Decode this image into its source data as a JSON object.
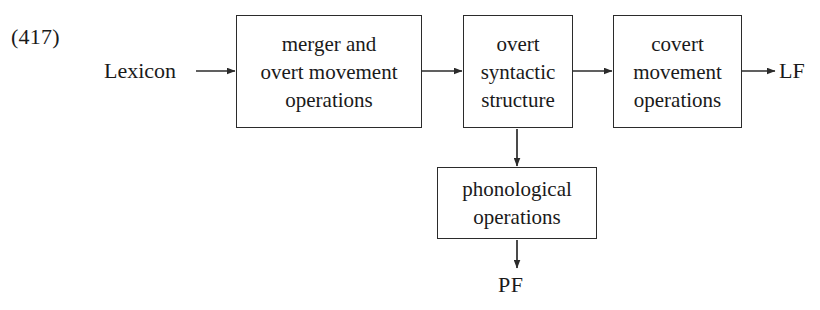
{
  "example_number": "(417)",
  "labels": {
    "lexicon": "Lexicon",
    "lf": "LF",
    "pf": "PF"
  },
  "boxes": {
    "merger": {
      "line1": "merger and",
      "line2": "overt movement",
      "line3": "operations"
    },
    "overt_syntactic_structure": {
      "line1": "overt",
      "line2": "syntactic",
      "line3": "structure"
    },
    "covert": {
      "line1": "covert",
      "line2": "movement",
      "line3": "operations"
    },
    "phonological": {
      "line1": "phonological",
      "line2": "operations"
    }
  },
  "colors": {
    "ink": "#1a1a1a",
    "stroke": "#2b2b2b",
    "background": "#ffffff"
  }
}
